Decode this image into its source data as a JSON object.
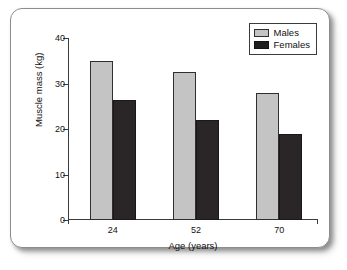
{
  "figure": {
    "frame_border_color": "#8d8d8d",
    "background_color": "#ffffff"
  },
  "legend": {
    "position": "top-right",
    "entries": [
      {
        "label": "Males",
        "color": "#c4c4c4"
      },
      {
        "label": "Females",
        "color": "#201d1e"
      }
    ]
  },
  "axes": {
    "y_title": "Muscle mass (kg)",
    "x_title": "Age (years)",
    "y_ticks": [
      "0",
      "10",
      "20",
      "30",
      "40"
    ],
    "x_ticks": [
      "24",
      "52",
      "70"
    ]
  },
  "chart_data": {
    "type": "bar",
    "title": "",
    "xlabel": "Age (years)",
    "ylabel": "Muscle mass (kg)",
    "categories": [
      "24",
      "52",
      "70"
    ],
    "series": [
      {
        "name": "Males",
        "color": "#c4c4c4",
        "values": [
          35,
          32.5,
          28
        ]
      },
      {
        "name": "Females",
        "color": "#201d1e",
        "values": [
          26.3,
          22,
          18.8
        ]
      }
    ],
    "ylim": [
      0,
      40
    ],
    "yticks": [
      0,
      10,
      20,
      30,
      40
    ],
    "grid": false,
    "legend_position": "top-right"
  }
}
